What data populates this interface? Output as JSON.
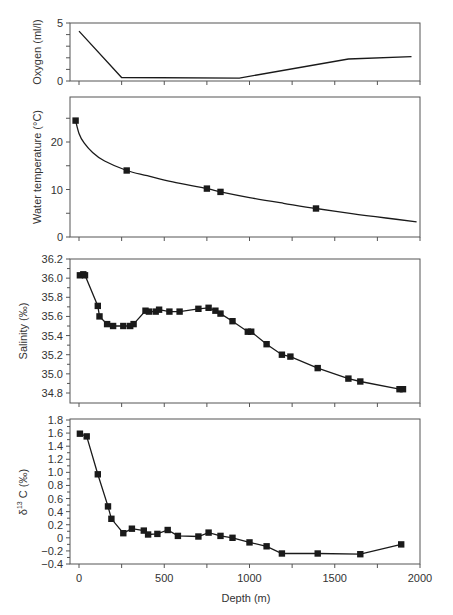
{
  "chart_data": [
    {
      "id": "oxygen",
      "type": "line",
      "title": "",
      "xlabel": "",
      "ylabel": "Oxygen (ml/l)",
      "xlim": [
        -53,
        2000
      ],
      "ylim": [
        0,
        5
      ],
      "yticks_labeled": [
        0,
        5
      ],
      "yticks_minor": [
        1,
        2,
        3,
        4
      ],
      "markers": false,
      "x": [
        0,
        250,
        940,
        1580,
        1950
      ],
      "y": [
        4.3,
        0.3,
        0.25,
        1.9,
        2.1
      ]
    },
    {
      "id": "temperature",
      "type": "line",
      "title": "",
      "xlabel": "",
      "ylabel": "Water temperature (°C)",
      "xlim": [
        -53,
        2000
      ],
      "ylim": [
        0,
        29.5
      ],
      "yticks_labeled": [
        0,
        10,
        20
      ],
      "yticks_minor": [
        5,
        15,
        25
      ],
      "markers": true,
      "curve": "smooth fit",
      "x": [
        -20,
        280,
        750,
        830,
        1390
      ],
      "y": [
        24.5,
        14.0,
        10.2,
        9.5,
        6.0
      ],
      "fit_curve": {
        "x": [
          -20,
          0,
          30,
          80,
          150,
          280,
          400,
          550,
          750,
          830,
          1000,
          1200,
          1390,
          1600,
          1800,
          1980
        ],
        "y": [
          24.5,
          21.8,
          19.8,
          17.8,
          16.0,
          14.0,
          12.9,
          11.6,
          10.2,
          9.5,
          8.3,
          7.1,
          6.0,
          4.9,
          4.0,
          3.2
        ]
      }
    },
    {
      "id": "salinity",
      "type": "line",
      "title": "",
      "xlabel": "",
      "ylabel": "Salinity (‰)",
      "xlim": [
        -53,
        2000
      ],
      "ylim": [
        34.7,
        36.2
      ],
      "yticks_labeled": [
        34.8,
        35.0,
        35.2,
        35.4,
        35.6,
        35.8,
        36.0,
        36.2
      ],
      "markers": true,
      "x": [
        5,
        25,
        35,
        110,
        120,
        165,
        200,
        260,
        300,
        320,
        390,
        410,
        450,
        470,
        530,
        590,
        700,
        760,
        800,
        830,
        900,
        990,
        1010,
        1100,
        1190,
        1240,
        1400,
        1580,
        1650,
        1880,
        1900
      ],
      "y": [
        36.03,
        36.04,
        36.03,
        35.71,
        35.6,
        35.52,
        35.5,
        35.5,
        35.5,
        35.52,
        35.66,
        35.65,
        35.65,
        35.67,
        35.65,
        35.65,
        35.68,
        35.69,
        35.66,
        35.63,
        35.55,
        35.44,
        35.44,
        35.31,
        35.2,
        35.18,
        35.06,
        34.95,
        34.92,
        34.84,
        34.84
      ]
    },
    {
      "id": "d13c",
      "type": "line",
      "title": "",
      "xlabel": "Depth (m)",
      "ylabel": "δ13C (‰)",
      "xlim": [
        -53,
        2000
      ],
      "ylim": [
        -0.4,
        1.8
      ],
      "xticks_labeled": [
        0,
        500,
        1000,
        1500,
        2000
      ],
      "xticks_minor": [
        250,
        750,
        1250,
        1750
      ],
      "yticks_labeled": [
        -0.4,
        -0.2,
        0,
        0.2,
        0.4,
        0.6,
        0.8,
        1.0,
        1.2,
        1.4,
        1.6,
        1.8
      ],
      "markers": true,
      "x": [
        5,
        45,
        110,
        170,
        190,
        260,
        310,
        380,
        405,
        460,
        520,
        580,
        700,
        760,
        830,
        900,
        1000,
        1100,
        1190,
        1400,
        1650,
        1890
      ],
      "y": [
        1.59,
        1.55,
        0.97,
        0.48,
        0.29,
        0.07,
        0.14,
        0.11,
        0.05,
        0.06,
        0.12,
        0.03,
        0.02,
        0.08,
        0.03,
        0.0,
        -0.07,
        -0.13,
        -0.24,
        -0.24,
        -0.25,
        -0.1
      ]
    }
  ],
  "labels": {
    "oxygen_ylabel": "Oxygen (ml/l)",
    "temp_ylabel": "Water temperature (°C)",
    "salinity_ylabel": "Salinity (‰)",
    "d13c_ylabel_delta": "δ",
    "d13c_ylabel_sup": "13",
    "d13c_ylabel_rest": " C (‰)",
    "xlabel": "Depth (m)"
  },
  "style": {
    "line_color": "#1a1a1a",
    "axis_color": "#555555",
    "text_color": "#333333",
    "background": "#ffffff"
  }
}
